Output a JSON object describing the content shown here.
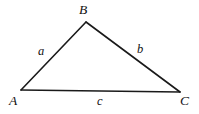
{
  "figure": {
    "kind": "triangle-diagram",
    "width": 199,
    "height": 114,
    "background_color": "#ffffff",
    "stroke_color": "#1a1a1a",
    "label_color": "#111111",
    "stroke_width": 1.6
  },
  "chart_data": {
    "type": "diagram",
    "title": "",
    "shape": "triangle",
    "vertices": [
      {
        "id": "A",
        "label": "A",
        "x": 21,
        "y": 90
      },
      {
        "id": "B",
        "label": "B",
        "x": 86,
        "y": 22
      },
      {
        "id": "C",
        "label": "C",
        "x": 180,
        "y": 92
      }
    ],
    "edges": [
      {
        "id": "AB",
        "label": "a",
        "from": "A",
        "to": "B"
      },
      {
        "id": "BC",
        "label": "b",
        "from": "B",
        "to": "C"
      },
      {
        "id": "AC",
        "label": "c",
        "from": "A",
        "to": "C"
      }
    ],
    "vertex_label_positions": [
      {
        "id": "A",
        "x": 9,
        "y": 94
      },
      {
        "id": "B",
        "x": 79,
        "y": 3
      },
      {
        "id": "C",
        "x": 180,
        "y": 94
      }
    ],
    "edge_label_positions": [
      {
        "id": "a",
        "x": 38,
        "y": 45
      },
      {
        "id": "b",
        "x": 137,
        "y": 43
      },
      {
        "id": "c",
        "x": 97,
        "y": 95
      }
    ]
  },
  "labels": {
    "vertex_a": "A",
    "vertex_b": "B",
    "vertex_c": "C",
    "side_a": "a",
    "side_b": "b",
    "side_c": "c"
  }
}
